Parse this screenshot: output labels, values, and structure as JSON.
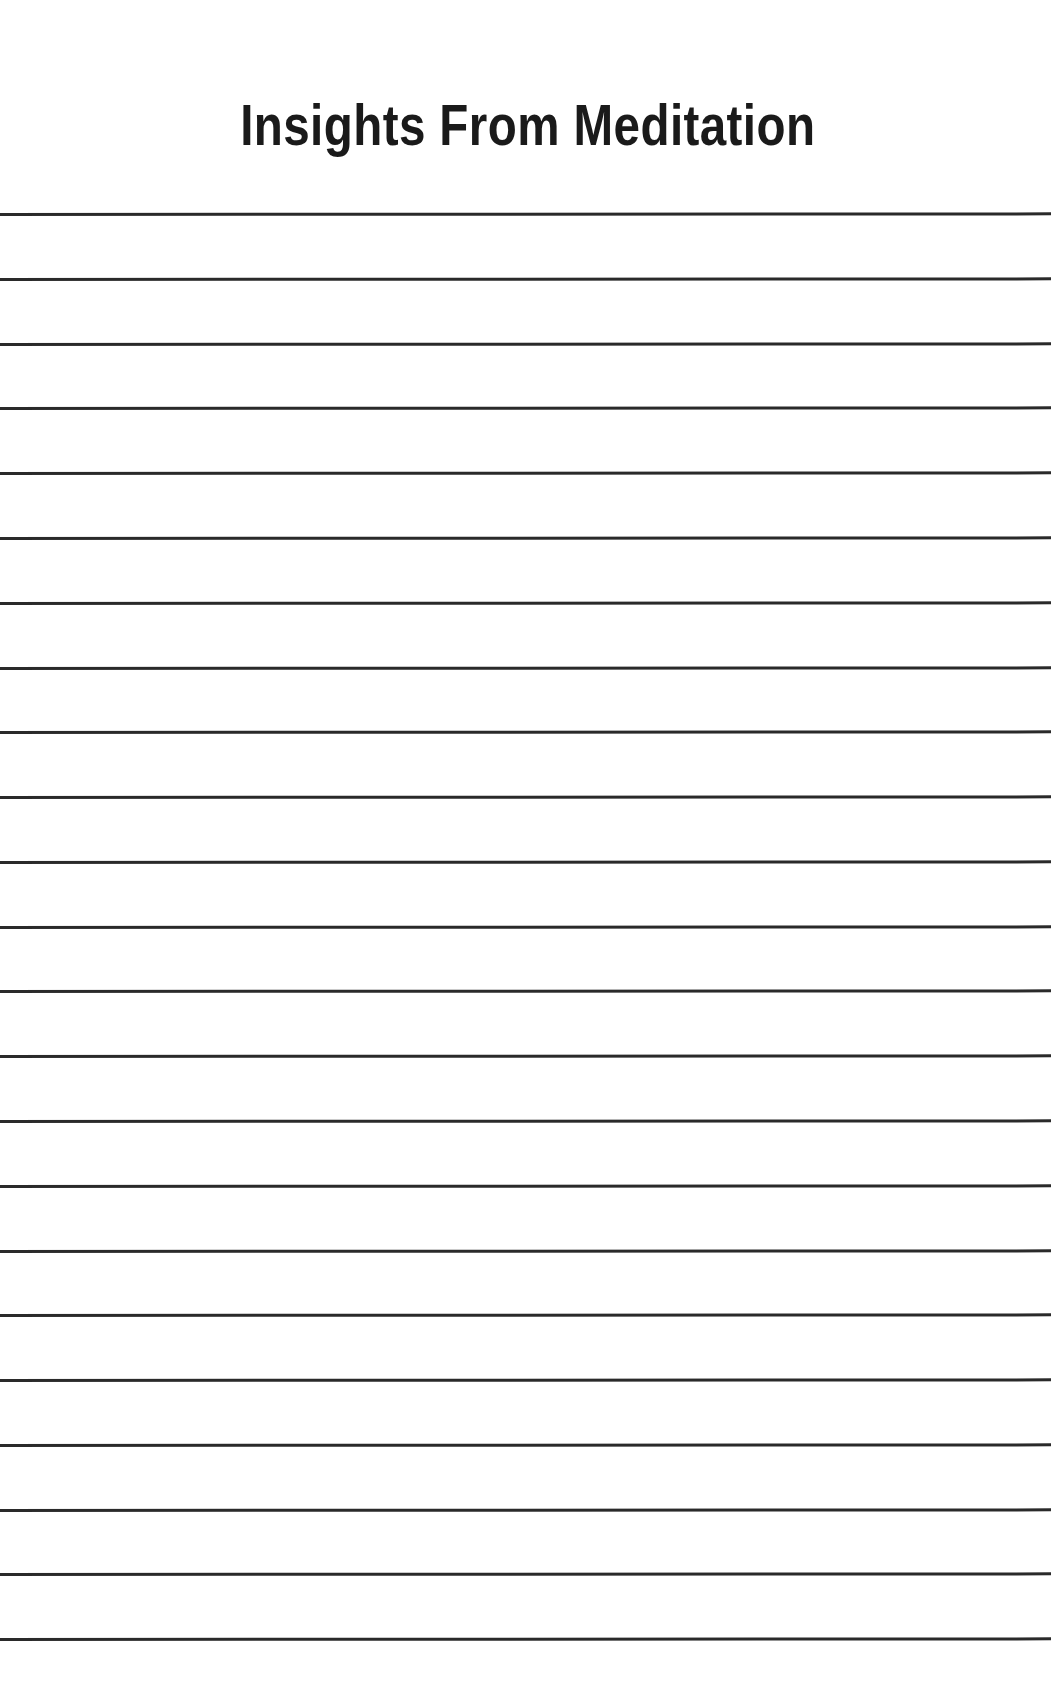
{
  "document": {
    "type": "printable-journal-page",
    "background_color": "#ffffff",
    "page_width": 1055,
    "page_height": 1698
  },
  "header": {
    "title": "Insights From Meditation",
    "title_color": "#1a1a1a",
    "title_align": "center"
  },
  "body": {
    "kind": "ruled-writing-lines",
    "line_color": "#2a2a2a",
    "line_thickness_px": 3,
    "line_count": 23,
    "first_line_y": 213,
    "line_spacing_px": 64.8,
    "line_left_x": 0,
    "line_right_x": 1051,
    "lines": [
      {
        "index": 1,
        "y": 213,
        "value": ""
      },
      {
        "index": 2,
        "y": 278,
        "value": ""
      },
      {
        "index": 3,
        "y": 343,
        "value": ""
      },
      {
        "index": 4,
        "y": 407,
        "value": ""
      },
      {
        "index": 5,
        "y": 472,
        "value": ""
      },
      {
        "index": 6,
        "y": 537,
        "value": ""
      },
      {
        "index": 7,
        "y": 602,
        "value": ""
      },
      {
        "index": 8,
        "y": 667,
        "value": ""
      },
      {
        "index": 9,
        "y": 731,
        "value": ""
      },
      {
        "index": 10,
        "y": 796,
        "value": ""
      },
      {
        "index": 11,
        "y": 861,
        "value": ""
      },
      {
        "index": 12,
        "y": 926,
        "value": ""
      },
      {
        "index": 13,
        "y": 990,
        "value": ""
      },
      {
        "index": 14,
        "y": 1055,
        "value": ""
      },
      {
        "index": 15,
        "y": 1120,
        "value": ""
      },
      {
        "index": 16,
        "y": 1185,
        "value": ""
      },
      {
        "index": 17,
        "y": 1250,
        "value": ""
      },
      {
        "index": 18,
        "y": 1314,
        "value": ""
      },
      {
        "index": 19,
        "y": 1379,
        "value": ""
      },
      {
        "index": 20,
        "y": 1444,
        "value": ""
      },
      {
        "index": 21,
        "y": 1509,
        "value": ""
      },
      {
        "index": 22,
        "y": 1573,
        "value": ""
      },
      {
        "index": 23,
        "y": 1638,
        "value": ""
      }
    ]
  }
}
